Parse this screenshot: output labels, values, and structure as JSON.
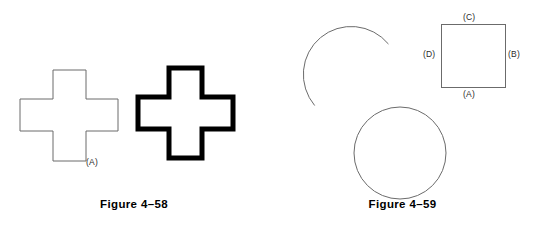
{
  "page": {
    "background_color": "#ffffff",
    "width": 537,
    "height": 225
  },
  "figures": [
    {
      "id": "figure-4-58",
      "caption": "Figure 4–58",
      "shapes": [
        {
          "name": "thin-cross",
          "type": "cross-outline",
          "stroke_color": "#6b6b6b",
          "stroke_width": 1,
          "fill": "none",
          "bbox": [
            20,
            70,
            98,
            92
          ]
        },
        {
          "name": "bold-cross",
          "type": "cross-outline",
          "stroke_color": "#000000",
          "stroke_width": 5,
          "fill": "none",
          "bbox": [
            136,
            66,
            99,
            94
          ]
        }
      ],
      "labels": [
        {
          "name": "label-a",
          "text": "(A)",
          "x": 86,
          "y": 157
        }
      ]
    },
    {
      "id": "figure-4-59",
      "caption": "Figure 4–59",
      "shapes": [
        {
          "name": "open-arc",
          "type": "arc",
          "stroke_color": "#6b6b6b",
          "stroke_width": 1,
          "fill": "none",
          "center": [
            344,
            70
          ],
          "radius": 46,
          "start_angle_deg": 130,
          "end_angle_deg": 318
        },
        {
          "name": "full-circle",
          "type": "circle",
          "stroke_color": "#6b6b6b",
          "stroke_width": 1,
          "fill": "none",
          "center": [
            400,
            153
          ],
          "radius": 46
        },
        {
          "name": "square",
          "type": "rect",
          "stroke_color": "#6b6b6b",
          "stroke_width": 1,
          "fill": "none",
          "bbox": [
            441,
            24,
            65,
            64
          ]
        }
      ],
      "labels": [
        {
          "name": "label-c",
          "text": "(C)",
          "x": 463,
          "y": 12
        },
        {
          "name": "label-d",
          "text": "(D)",
          "x": 423,
          "y": 49
        },
        {
          "name": "label-b",
          "text": "(B)",
          "x": 508,
          "y": 49
        },
        {
          "name": "label-a",
          "text": "(A)",
          "x": 463,
          "y": 89
        }
      ]
    }
  ]
}
